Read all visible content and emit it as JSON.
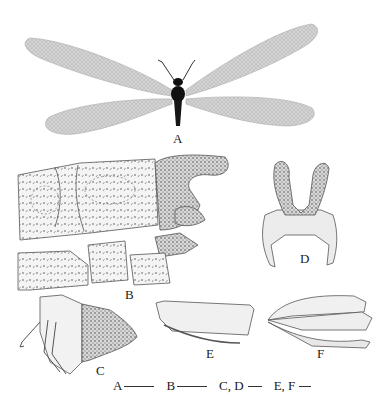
{
  "figure": {
    "panels": [
      {
        "id": "A",
        "label": "A",
        "subject": "adult-lacewing-habitus"
      },
      {
        "id": "B",
        "label": "B",
        "subject": "male-terminalia-lateral"
      },
      {
        "id": "C",
        "label": "C",
        "subject": "genital-structure-lateral"
      },
      {
        "id": "D",
        "label": "D",
        "subject": "genital-structure-dorsal"
      },
      {
        "id": "E",
        "label": "E",
        "subject": "sclerite-lateral"
      },
      {
        "id": "F",
        "label": "F",
        "subject": "sclerite-ventral"
      }
    ],
    "scale_bars": [
      {
        "label": "A",
        "length_px": 30
      },
      {
        "label": "B",
        "length_px": 30
      },
      {
        "label": "C, D",
        "length_px": 14
      },
      {
        "label": "E, F",
        "length_px": 12
      }
    ],
    "colors": {
      "wing": "#c9c9c9",
      "body": "#111111",
      "line": "#555555",
      "fill_light": "#ececec"
    }
  }
}
